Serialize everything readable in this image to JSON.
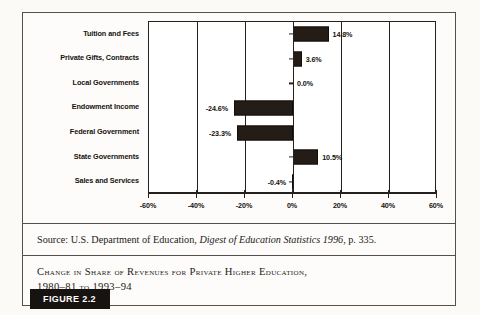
{
  "figure": {
    "badge_label": "FIGURE 2.2",
    "source_prefix": "Source: U.S. Department of Education, ",
    "source_italic": "Digest of Education Statistics 1996",
    "source_suffix": ", p. 335.",
    "caption_line1": "Change in Share of Revenues for Private Higher Education,",
    "caption_line2": "1980–81 to 1993–94"
  },
  "chart_data": {
    "type": "bar",
    "orientation": "horizontal",
    "title": "Change in Share of Revenues for Private Higher Education, 1980–81 to 1993–94",
    "xlabel": "",
    "ylabel": "",
    "xlim": [
      -60,
      60
    ],
    "grid": true,
    "legend": "none",
    "bar_color": "#241c16",
    "categories": [
      "Tuition and Fees",
      "Private Gifts, Contracts",
      "Local Governments",
      "Endowment Income",
      "Federal Government",
      "State Governments",
      "Sales and Services"
    ],
    "values": [
      14.8,
      3.6,
      0.0,
      -24.6,
      -23.3,
      10.5,
      -0.4
    ],
    "value_labels": [
      "14.8%",
      "3.6%",
      "0.0%",
      "-24.6%",
      "-23.3%",
      "10.5%",
      "-0.4%"
    ],
    "xticks": [
      -60,
      -40,
      -20,
      0,
      20,
      40,
      60
    ],
    "xtick_labels": [
      "-60%",
      "-40%",
      "-20%",
      "0%",
      "20%",
      "40%",
      "60%"
    ]
  }
}
